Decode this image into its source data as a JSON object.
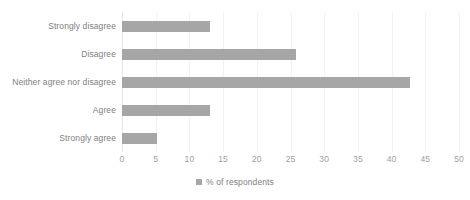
{
  "chart_data": {
    "type": "bar",
    "orientation": "horizontal",
    "title": "",
    "xlabel": "",
    "ylabel": "",
    "categories": [
      "Strongly disagree",
      "Disagree",
      "Neither agree nor disagree",
      "Agree",
      "Strongly agree"
    ],
    "values": [
      13,
      25.8,
      42.8,
      13,
      5.2
    ],
    "series": [
      {
        "name": "% of respondents",
        "values": [
          13,
          25.8,
          42.8,
          13,
          5.2
        ],
        "color": "#a6a6a6"
      }
    ],
    "xlim": [
      0,
      50
    ],
    "xticks": [
      0,
      5,
      10,
      15,
      20,
      25,
      30,
      35,
      40,
      45,
      50
    ],
    "xtick_labels": [
      "0",
      "5",
      "10",
      "15",
      "20",
      "25",
      "30",
      "35",
      "40",
      "45",
      "50"
    ],
    "grid": "vertical",
    "legend": {
      "position": "bottom-center",
      "entries": [
        {
          "label": "% of respondents",
          "color": "#a6a6a6",
          "marker": "square-marker"
        }
      ]
    },
    "colors": {
      "bar": "#a6a6a6",
      "text": "#808080",
      "tick_text": "#a0a0a0",
      "gridline": "#f2f2f2",
      "axis": "#e6e6e6",
      "background": "#ffffff"
    }
  }
}
